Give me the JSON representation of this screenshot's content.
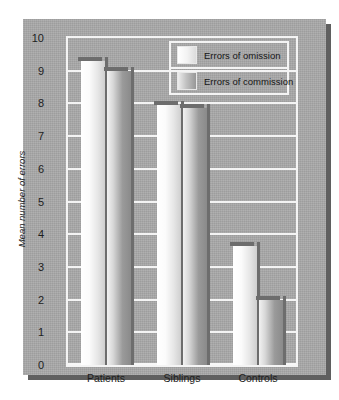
{
  "chart_data": {
    "type": "bar",
    "title": "",
    "xlabel": "",
    "ylabel": "Mean number of errors",
    "categories": [
      "Patients",
      "Siblings",
      "Controls"
    ],
    "series": [
      {
        "name": "Errors of omission",
        "values": [
          9.3,
          7.95,
          3.65
        ]
      },
      {
        "name": "Errors of commission",
        "values": [
          9.0,
          7.85,
          2.0
        ]
      }
    ],
    "ylim": [
      0,
      10
    ],
    "yticks": [
      10,
      9,
      8,
      7,
      6,
      5,
      4,
      3,
      2,
      1,
      0
    ],
    "grid": true,
    "legend_position": "top-right-inside"
  },
  "legend": {
    "items": [
      {
        "label": "Errors of omission",
        "swatch": "omission-swatch"
      },
      {
        "label": "Errors of commission",
        "swatch": "commission-swatch"
      }
    ]
  },
  "colors": {
    "panel_background": "#a8a8a8",
    "gridline": "#f4f4f4",
    "bar_shadow": "#6d6d6d",
    "text": "#1d1d1d",
    "page_background": "#ffffff"
  }
}
